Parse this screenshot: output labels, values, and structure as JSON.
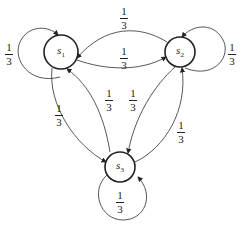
{
  "diagram": {
    "type": "markov-chain-state-diagram",
    "nodes": [
      {
        "id": "s1",
        "label": "s",
        "sub": "1"
      },
      {
        "id": "s2",
        "label": "s",
        "sub": "2"
      },
      {
        "id": "s3",
        "label": "s",
        "sub": "3"
      }
    ],
    "edges": [
      {
        "from": "s1",
        "to": "s1",
        "prob_num": "1",
        "prob_den": "3"
      },
      {
        "from": "s2",
        "to": "s1",
        "prob_num": "1",
        "prob_den": "3"
      },
      {
        "from": "s1",
        "to": "s2",
        "prob_num": "1",
        "prob_den": "3"
      },
      {
        "from": "s2",
        "to": "s2",
        "prob_num": "1",
        "prob_den": "3"
      },
      {
        "from": "s1",
        "to": "s3",
        "prob_num": "1",
        "prob_den": "3"
      },
      {
        "from": "s3",
        "to": "s1",
        "prob_num": "1",
        "prob_den": "3"
      },
      {
        "from": "s3",
        "to": "s2",
        "prob_num": "1",
        "prob_den": "3"
      },
      {
        "from": "s2",
        "to": "s3",
        "prob_num": "1",
        "prob_den": "3"
      },
      {
        "from": "s3",
        "to": "s3",
        "prob_num": "1",
        "prob_den": "3"
      }
    ]
  }
}
